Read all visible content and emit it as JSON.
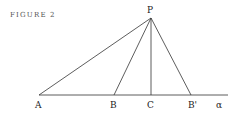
{
  "caption": "FIGURE 2",
  "points": {
    "P": {
      "label": "P",
      "x": 151,
      "y": 18
    },
    "A": {
      "label": "A",
      "x": 39,
      "y": 95
    },
    "B": {
      "label": "B",
      "x": 114,
      "y": 95
    },
    "C": {
      "label": "C",
      "x": 151,
      "y": 95
    },
    "Bp": {
      "label": "B'",
      "x": 191,
      "y": 95
    }
  },
  "line_label": "α",
  "segments": [
    "PA",
    "PB",
    "PC",
    "PB'",
    "A-α baseline"
  ]
}
